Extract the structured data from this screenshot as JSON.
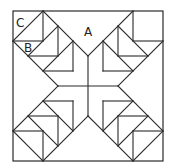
{
  "diagram": {
    "title": "",
    "labels": {
      "a": "A",
      "b": "B",
      "c": "C"
    },
    "colors": {
      "stroke": "#2a2a2a",
      "background": "#ffffff",
      "text": "#222222"
    },
    "grid": {
      "units": 5,
      "origin_px": [
        13,
        11
      ],
      "unit_px": 30
    }
  }
}
